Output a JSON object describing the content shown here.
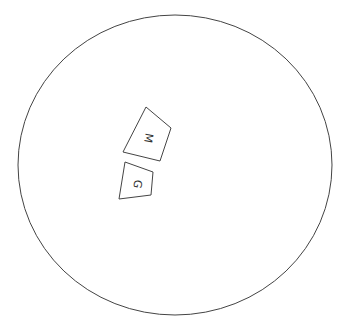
{
  "diagram": {
    "outline_color": "#444444",
    "boundary": {
      "shape": "ellipse",
      "cx": 175,
      "cy": 165,
      "rx": 157,
      "ry": 150
    },
    "blocks": [
      {
        "id": "M",
        "label": "M",
        "points": "146,107 171,128 160,161 123,152",
        "label_x": 148,
        "label_y": 134,
        "label_rotation": 110
      },
      {
        "id": "G",
        "label": "G",
        "points": "125,162 153,172 151,195 119,199",
        "label_x": 137,
        "label_y": 184,
        "label_rotation": 100
      }
    ]
  }
}
